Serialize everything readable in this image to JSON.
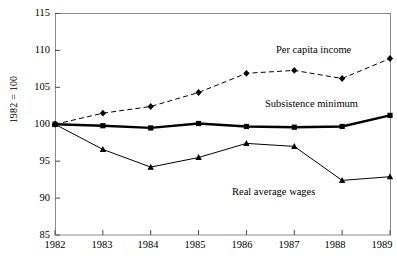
{
  "chart_data": {
    "type": "line",
    "title": "",
    "xlabel": "",
    "ylabel": "1982 = 100",
    "categories": [
      1982,
      1983,
      1984,
      1985,
      1986,
      1987,
      1988,
      1989
    ],
    "xlim": [
      1982,
      1989
    ],
    "ylim": [
      85,
      115
    ],
    "yticks": [
      85,
      90,
      95,
      100,
      105,
      110,
      115
    ],
    "xticks": [
      "1982",
      "1983",
      "1984",
      "1985",
      "1986",
      "1987",
      "1988",
      "1989"
    ],
    "grid": false,
    "legend_position": "inline-annotations",
    "series": [
      {
        "name": "Per capita income",
        "values": [
          100.0,
          101.5,
          102.4,
          104.3,
          106.9,
          107.3,
          106.2,
          108.9
        ],
        "line_style": "dashed",
        "line_width": 1,
        "marker": "diamond",
        "color": "#000000"
      },
      {
        "name": "Subsistence minimum",
        "values": [
          100.0,
          99.8,
          99.5,
          100.1,
          99.7,
          99.6,
          99.7,
          101.2
        ],
        "line_style": "solid",
        "line_width": 2.4,
        "marker": "square",
        "color": "#000000"
      },
      {
        "name": "Real average wages",
        "values": [
          100.0,
          96.6,
          94.2,
          95.5,
          97.4,
          97.0,
          92.4,
          92.9
        ],
        "line_style": "solid",
        "line_width": 1,
        "marker": "triangle",
        "color": "#000000"
      }
    ],
    "annotations": [
      {
        "text": "Per capita income",
        "series": "Per capita income"
      },
      {
        "text": "Subsistence minimum",
        "series": "Subsistence minimum"
      },
      {
        "text": "Real average wages",
        "series": "Real average wages"
      }
    ]
  },
  "axis": {
    "y_label": "1982 = 100",
    "y_ticks": [
      "115",
      "110",
      "105",
      "100",
      "95",
      "90",
      "85"
    ],
    "x_ticks": [
      "1982",
      "1983",
      "1984",
      "1985",
      "1986",
      "1987",
      "1988",
      "1989"
    ]
  },
  "labels": {
    "income": "Per capita income",
    "subsistence": "Subsistence minimum",
    "wages": "Real average wages"
  },
  "colors": {
    "ink": "#000000",
    "frame": "#8a8a8a",
    "background": "#ffffff"
  }
}
